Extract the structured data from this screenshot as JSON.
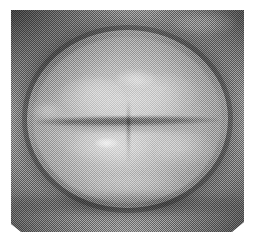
{
  "document": {
    "type": "scanned-photograph",
    "caption": "",
    "page_background": "#ffffff",
    "print_tone": "grayscale-halftone"
  },
  "photo": {
    "subject": "closed human mouth and lips",
    "orientation": "landscape",
    "plate": {
      "left_px": 11,
      "top_px": 10,
      "width_px": 233,
      "height_px": 222
    },
    "margins_px": {
      "top": 10,
      "right": 10,
      "bottom": 8,
      "left": 11
    },
    "palette": {
      "paper_white": "#ffffff",
      "midtone_gray": "#8b8b8b",
      "shadow_dark": "#3a3a3a",
      "highlight_light": "#e6e6e6",
      "plate_base": "#8b8b8b"
    },
    "texture": {
      "screen": "halftone-dot",
      "dot_pitch_px": 2,
      "screen_angle_deg": 45,
      "grain": "paper-speckle"
    },
    "regions": [
      {
        "name": "outer-shadow-ring",
        "description": "dark vignetted skin surrounding the lips"
      },
      {
        "name": "lip-border-arc",
        "description": "dark vermilion border outlining the lip mass"
      },
      {
        "name": "lip-mass",
        "description": "bright elliptical upper and lower lips"
      },
      {
        "name": "upper-lip-left-lobe",
        "description": "left cupid's bow lobe"
      },
      {
        "name": "upper-lip-right-lobe",
        "description": "right cupid's bow lobe"
      },
      {
        "name": "mouth-line",
        "description": "dark horizontal line where lips meet"
      },
      {
        "name": "center-crease",
        "description": "vertical crease below the mouth centre"
      },
      {
        "name": "chin-shadow",
        "description": "soft shadow band below the lower lip"
      }
    ],
    "highlights": [
      {
        "name": "upper-lip-highlight",
        "x_pct": 53,
        "y_pct": 31,
        "intensity": "medium"
      },
      {
        "name": "lower-lip-specular",
        "x_pct": 41,
        "y_pct": 60,
        "intensity": "strong"
      },
      {
        "name": "lower-lip-broad-sheen",
        "x_pct": 42,
        "y_pct": 61,
        "intensity": "soft"
      },
      {
        "name": "right-lip-sheen",
        "x_pct": 75,
        "y_pct": 63,
        "intensity": "soft"
      },
      {
        "name": "left-corner-glint",
        "x_pct": 15,
        "y_pct": 45,
        "intensity": "medium"
      },
      {
        "name": "top-skin-glint",
        "x_pct": 83,
        "y_pct": 6,
        "intensity": "faint"
      }
    ]
  }
}
